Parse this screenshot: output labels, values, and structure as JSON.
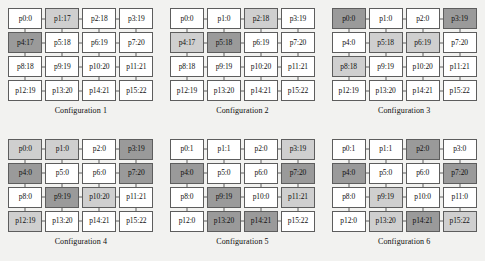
{
  "figure": {
    "background_color": "#f2f2f0",
    "node_colors": {
      "idle": "#ffffff",
      "light": "#cfcfcf",
      "dark": "#9a9a9a",
      "border": "#5d5d5d"
    },
    "grid": {
      "rows": 4,
      "cols": 4
    }
  },
  "configurations": [
    {
      "caption": "Configuration 1",
      "nodes": [
        {
          "label": "p0:0",
          "shade": "none"
        },
        {
          "label": "p1:17",
          "shade": "light"
        },
        {
          "label": "p2:18",
          "shade": "none"
        },
        {
          "label": "p3:19",
          "shade": "none"
        },
        {
          "label": "p4:17",
          "shade": "dark"
        },
        {
          "label": "p5:18",
          "shade": "none"
        },
        {
          "label": "p6:19",
          "shade": "none"
        },
        {
          "label": "p7:20",
          "shade": "none"
        },
        {
          "label": "p8:18",
          "shade": "none"
        },
        {
          "label": "p9:19",
          "shade": "none"
        },
        {
          "label": "p10:20",
          "shade": "none"
        },
        {
          "label": "p11:21",
          "shade": "none"
        },
        {
          "label": "p12:19",
          "shade": "none"
        },
        {
          "label": "p13:20",
          "shade": "none"
        },
        {
          "label": "p14:21",
          "shade": "none"
        },
        {
          "label": "p15:22",
          "shade": "none"
        }
      ]
    },
    {
      "caption": "Configuration 2",
      "nodes": [
        {
          "label": "p0:0",
          "shade": "none"
        },
        {
          "label": "p1:0",
          "shade": "none"
        },
        {
          "label": "p2:18",
          "shade": "light"
        },
        {
          "label": "p3:19",
          "shade": "none"
        },
        {
          "label": "p4:17",
          "shade": "light"
        },
        {
          "label": "p5:18",
          "shade": "dark"
        },
        {
          "label": "p6:19",
          "shade": "none"
        },
        {
          "label": "p7:20",
          "shade": "none"
        },
        {
          "label": "p8:18",
          "shade": "none"
        },
        {
          "label": "p9:19",
          "shade": "none"
        },
        {
          "label": "p10:20",
          "shade": "none"
        },
        {
          "label": "p11:21",
          "shade": "none"
        },
        {
          "label": "p12:19",
          "shade": "none"
        },
        {
          "label": "p13:20",
          "shade": "none"
        },
        {
          "label": "p14:21",
          "shade": "none"
        },
        {
          "label": "p15:22",
          "shade": "none"
        }
      ]
    },
    {
      "caption": "Configuration 3",
      "nodes": [
        {
          "label": "p0:0",
          "shade": "dark"
        },
        {
          "label": "p1:0",
          "shade": "none"
        },
        {
          "label": "p2:0",
          "shade": "none"
        },
        {
          "label": "p3:19",
          "shade": "dark"
        },
        {
          "label": "p4:0",
          "shade": "none"
        },
        {
          "label": "p5:18",
          "shade": "light"
        },
        {
          "label": "p6:19",
          "shade": "light"
        },
        {
          "label": "p7:20",
          "shade": "none"
        },
        {
          "label": "p8:18",
          "shade": "light"
        },
        {
          "label": "p9:19",
          "shade": "none"
        },
        {
          "label": "p10:20",
          "shade": "none"
        },
        {
          "label": "p11:21",
          "shade": "none"
        },
        {
          "label": "p12:19",
          "shade": "none"
        },
        {
          "label": "p13:20",
          "shade": "none"
        },
        {
          "label": "p14:21",
          "shade": "none"
        },
        {
          "label": "p15:22",
          "shade": "none"
        }
      ]
    },
    {
      "caption": "Configuration 4",
      "nodes": [
        {
          "label": "p0:0",
          "shade": "light"
        },
        {
          "label": "p1:0",
          "shade": "light"
        },
        {
          "label": "p2:0",
          "shade": "none"
        },
        {
          "label": "p3:19",
          "shade": "dark"
        },
        {
          "label": "p4:0",
          "shade": "dark"
        },
        {
          "label": "p5:0",
          "shade": "none"
        },
        {
          "label": "p6:0",
          "shade": "none"
        },
        {
          "label": "p7:20",
          "shade": "dark"
        },
        {
          "label": "p8:0",
          "shade": "none"
        },
        {
          "label": "p9:19",
          "shade": "dark"
        },
        {
          "label": "p10:20",
          "shade": "light"
        },
        {
          "label": "p11:21",
          "shade": "none"
        },
        {
          "label": "p12:19",
          "shade": "light"
        },
        {
          "label": "p13:20",
          "shade": "none"
        },
        {
          "label": "p14:21",
          "shade": "none"
        },
        {
          "label": "p15:22",
          "shade": "none"
        }
      ]
    },
    {
      "caption": "Configuration 5",
      "nodes": [
        {
          "label": "p0:1",
          "shade": "none"
        },
        {
          "label": "p1:1",
          "shade": "none"
        },
        {
          "label": "p2:0",
          "shade": "none"
        },
        {
          "label": "p3:19",
          "shade": "light"
        },
        {
          "label": "p4:0",
          "shade": "dark"
        },
        {
          "label": "p5:0",
          "shade": "none"
        },
        {
          "label": "p6:0",
          "shade": "none"
        },
        {
          "label": "p7:20",
          "shade": "dark"
        },
        {
          "label": "p8:0",
          "shade": "none"
        },
        {
          "label": "p9:19",
          "shade": "dark"
        },
        {
          "label": "p10:0",
          "shade": "none"
        },
        {
          "label": "p11:21",
          "shade": "light"
        },
        {
          "label": "p12:0",
          "shade": "none"
        },
        {
          "label": "p13:20",
          "shade": "dark"
        },
        {
          "label": "p14:21",
          "shade": "dark"
        },
        {
          "label": "p15:22",
          "shade": "none"
        }
      ]
    },
    {
      "caption": "Configuration 6",
      "nodes": [
        {
          "label": "p0:1",
          "shade": "none"
        },
        {
          "label": "p1:1",
          "shade": "none"
        },
        {
          "label": "p2:0",
          "shade": "dark"
        },
        {
          "label": "p3:0",
          "shade": "none"
        },
        {
          "label": "p4:0",
          "shade": "dark"
        },
        {
          "label": "p5:0",
          "shade": "none"
        },
        {
          "label": "p6:0",
          "shade": "none"
        },
        {
          "label": "p7:20",
          "shade": "dark"
        },
        {
          "label": "p8:0",
          "shade": "none"
        },
        {
          "label": "p9:19",
          "shade": "light"
        },
        {
          "label": "p10:0",
          "shade": "none"
        },
        {
          "label": "p11:0",
          "shade": "none"
        },
        {
          "label": "p12:0",
          "shade": "none"
        },
        {
          "label": "p13:20",
          "shade": "light"
        },
        {
          "label": "p14:21",
          "shade": "dark"
        },
        {
          "label": "p15:22",
          "shade": "light"
        }
      ]
    }
  ]
}
